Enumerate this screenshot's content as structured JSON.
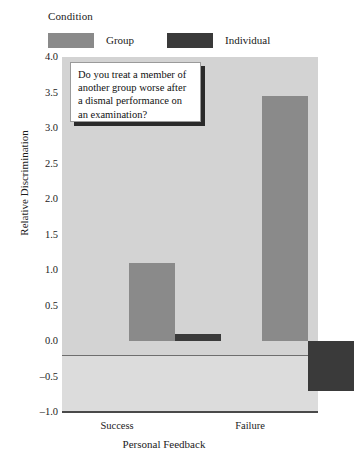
{
  "legend": {
    "title": "Condition",
    "entries": [
      {
        "label": "Group",
        "color": "#8a8a8a"
      },
      {
        "label": "Individual",
        "color": "#3a3a3a"
      }
    ]
  },
  "callout": {
    "text": "Do you treat a member of another group worse after a dismal performance on an examination?"
  },
  "axes": {
    "ylabel": "Relative Discrimination",
    "xlabel": "Personal Feedback",
    "yticks": [
      "4.0",
      "3.5",
      "3.0",
      "2.5",
      "2.0",
      "1.5",
      "1.0",
      "0.5",
      "0.0",
      "-0.5",
      "-1.0"
    ],
    "xticks": [
      "Success",
      "Failure"
    ]
  },
  "chart_data": {
    "type": "bar",
    "title": "",
    "subtitle": "",
    "xlabel": "Personal Feedback",
    "ylabel": "Relative Discrimination",
    "categories": [
      "Success",
      "Failure"
    ],
    "series": [
      {
        "name": "Group",
        "color": "#8a8a8a",
        "values": [
          1.1,
          3.45
        ]
      },
      {
        "name": "Individual",
        "color": "#3a3a3a",
        "values": [
          0.1,
          -0.7
        ]
      }
    ],
    "ylim": [
      -1.0,
      4.0
    ],
    "ytick_step": 0.5,
    "grid": false,
    "legend_position": "top-left",
    "legend_title": "Condition",
    "annotations": [
      {
        "type": "textbox",
        "text": "Do you treat a member of another group worse after a dismal performance on an examination?"
      }
    ]
  }
}
